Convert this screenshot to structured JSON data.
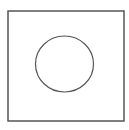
{
  "diagram": {
    "shapes": [
      {
        "kind": "square",
        "label": "outer-square"
      },
      {
        "kind": "circle",
        "label": "inner-circle"
      }
    ],
    "colors": {
      "stroke": "#555555",
      "fill": "#ffffff",
      "background": "#ffffff"
    }
  }
}
